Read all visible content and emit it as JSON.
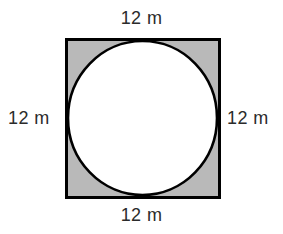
{
  "figure": {
    "kind": "inscribed-circle-in-square",
    "unit": "m",
    "side_length": 12,
    "labels": {
      "top": "12 m",
      "right": "12 m",
      "bottom": "12 m",
      "left": "12 m"
    },
    "square": {
      "x": 66,
      "y": 39,
      "width": 153,
      "height": 158,
      "fill": "#b9b9b9",
      "stroke": "#000000",
      "stroke_width": 3
    },
    "circle": {
      "cx": 142.5,
      "cy": 118,
      "rx": 75,
      "ry": 77.5,
      "fill": "#ffffff",
      "stroke": "#000000",
      "stroke_width": 2.6
    },
    "colors": {
      "background": "#ffffff",
      "shaded_region": "#b9b9b9",
      "outline": "#000000",
      "label_text": "#2b2b2b"
    }
  }
}
